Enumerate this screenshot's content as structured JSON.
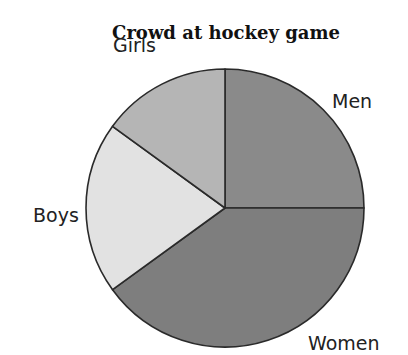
{
  "chart_data": {
    "type": "pie",
    "title": "Crowd at hockey game",
    "categories": [
      "Men",
      "Women",
      "Boys",
      "Girls"
    ],
    "values": [
      25,
      40,
      20,
      15
    ],
    "units": "percent (estimated from slice angles)",
    "start_angle_deg": 0,
    "direction": "clockwise",
    "colors": [
      "#8a8a8a",
      "#7e7e7e",
      "#e2e2e2",
      "#b5b5b5"
    ],
    "stroke_color": "#2a2a2a",
    "legend": "none (direct labels outside slices)"
  },
  "labels": {
    "title": "Crowd at hockey game",
    "men": "Men",
    "women": "Women",
    "boys": "Boys",
    "girls": "Girls"
  }
}
